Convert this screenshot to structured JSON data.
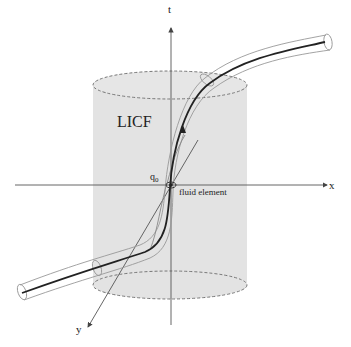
{
  "diagram": {
    "type": "3d-spacetime-schematic",
    "labels": {
      "t_axis": "t",
      "x_axis": "x",
      "y_axis": "y",
      "region": "LICF",
      "point": "q",
      "point_subscript": "0",
      "element": "fluid element"
    },
    "colors": {
      "cylinder_fill": "#e3e3e3",
      "dashed_edge": "#777777",
      "axis": "#555555",
      "worldline": "#222222",
      "tube": "#999999"
    }
  }
}
